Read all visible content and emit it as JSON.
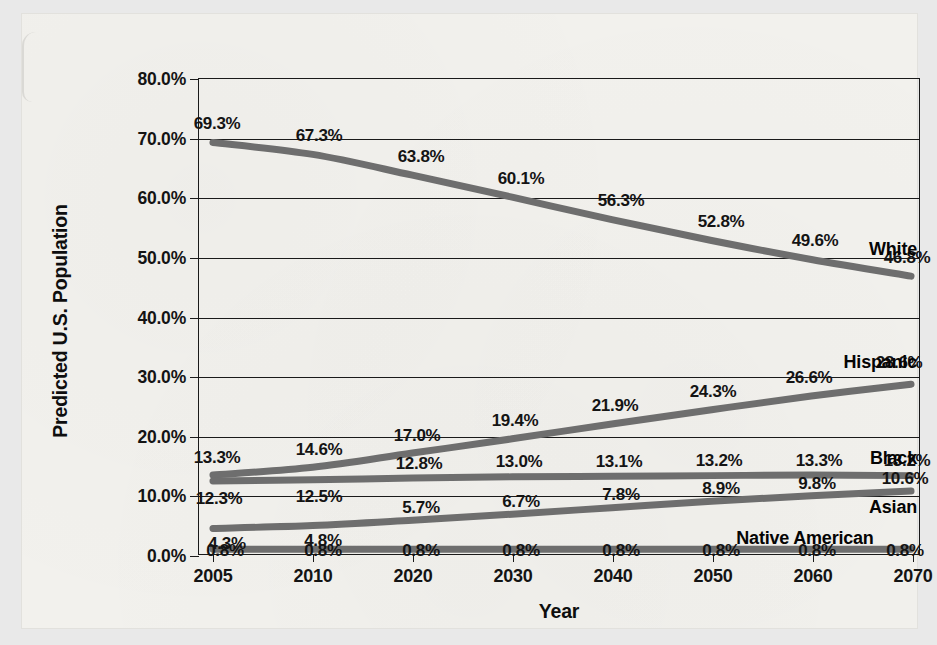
{
  "chart_data": {
    "type": "line",
    "title": "",
    "xlabel": "Year",
    "ylabel": "Predicted U.S. Population",
    "x": [
      2005,
      2010,
      2020,
      2030,
      2040,
      2050,
      2060,
      2070
    ],
    "categories": [
      "2005",
      "2010",
      "2020",
      "2030",
      "2040",
      "2050",
      "2060",
      "2070"
    ],
    "ylim": [
      0,
      80
    ],
    "ytick_labels": [
      "0.0%",
      "10.0%",
      "20.0%",
      "30.0%",
      "40.0%",
      "50.0%",
      "60.0%",
      "70.0%",
      "80.0%"
    ],
    "ytick_values": [
      0,
      10,
      20,
      30,
      40,
      50,
      60,
      70,
      80
    ],
    "grid": true,
    "legend_position": "inline-right",
    "line_color": "#6e6e6e",
    "axis_color": "#1a1a1a",
    "series": [
      {
        "name": "White",
        "values": [
          69.3,
          67.3,
          63.8,
          60.1,
          56.3,
          52.8,
          49.6,
          46.8
        ],
        "labels": [
          "69.3%",
          "67.3%",
          "63.8%",
          "60.1%",
          "56.3%",
          "52.8%",
          "49.6%",
          "46.8%"
        ]
      },
      {
        "name": "Hispanic",
        "values": [
          13.3,
          14.6,
          17.0,
          19.4,
          21.9,
          24.3,
          26.6,
          28.6
        ],
        "labels": [
          "13.3%",
          "14.6%",
          "17.0%",
          "19.4%",
          "21.9%",
          "24.3%",
          "26.6%",
          "28.6%"
        ]
      },
      {
        "name": "Black",
        "values": [
          12.3,
          12.5,
          12.8,
          13.0,
          13.1,
          13.2,
          13.3,
          13.2
        ],
        "labels": [
          "12.3%",
          "12.5%",
          "12.8%",
          "13.0%",
          "13.1%",
          "13.2%",
          "13.3%",
          "13.2%"
        ]
      },
      {
        "name": "Asian",
        "values": [
          4.3,
          4.8,
          5.7,
          6.7,
          7.8,
          8.9,
          9.8,
          10.6
        ],
        "labels": [
          "4.3%",
          "4.8%",
          "5.7%",
          "6.7%",
          "7.8%",
          "8.9%",
          "9.8%",
          "10.6%"
        ]
      },
      {
        "name": "Native American",
        "values": [
          0.8,
          0.8,
          0.8,
          0.8,
          0.8,
          0.8,
          0.8,
          0.8
        ],
        "labels": [
          "0.8%",
          "0.8%",
          "0.8%",
          "0.8%",
          "0.8%",
          "0.8%",
          "0.8%",
          "0.8%"
        ]
      }
    ]
  },
  "layout": {
    "series_name_anchor": [
      {
        "name": "White",
        "x_frac": 1.0,
        "y_value": 51.5
      },
      {
        "name": "Hispanic",
        "x_frac": 1.0,
        "y_value": 32.6
      },
      {
        "name": "Black",
        "x_frac": 1.0,
        "y_value": 16.5
      },
      {
        "name": "Asian",
        "x_frac": 1.0,
        "y_value": 8.3
      },
      {
        "name": "Native American",
        "x_frac": 0.94,
        "y_value": 3.1
      }
    ],
    "label_offsets": {
      "White": [
        {
          "dx": 4,
          "dy": -19
        },
        {
          "dx": 6,
          "dy": -19
        },
        {
          "dx": 8,
          "dy": -19
        },
        {
          "dx": 8,
          "dy": -19
        },
        {
          "dx": 8,
          "dy": -19
        },
        {
          "dx": 8,
          "dy": -19
        },
        {
          "dx": 2,
          "dy": -19
        },
        {
          "dx": -6,
          "dy": -19
        }
      ],
      "Hispanic": [
        {
          "dx": 4,
          "dy": -19
        },
        {
          "dx": 6,
          "dy": -19
        },
        {
          "dx": 4,
          "dy": -19
        },
        {
          "dx": 2,
          "dy": -19
        },
        {
          "dx": 2,
          "dy": -19
        },
        {
          "dx": 0,
          "dy": -19
        },
        {
          "dx": -4,
          "dy": -19
        },
        {
          "dx": -14,
          "dy": -22
        }
      ],
      "Black": [
        {
          "dx": 6,
          "dy": 16
        },
        {
          "dx": 6,
          "dy": 16
        },
        {
          "dx": 6,
          "dy": -16
        },
        {
          "dx": 6,
          "dy": -16
        },
        {
          "dx": 6,
          "dy": -16
        },
        {
          "dx": 6,
          "dy": -16
        },
        {
          "dx": 6,
          "dy": -16
        },
        {
          "dx": -6,
          "dy": -16
        }
      ],
      "Asian": [
        {
          "dx": 14,
          "dy": 14
        },
        {
          "dx": 10,
          "dy": 14
        },
        {
          "dx": 8,
          "dy": -14
        },
        {
          "dx": 8,
          "dy": -14
        },
        {
          "dx": 8,
          "dy": -14
        },
        {
          "dx": 8,
          "dy": -14
        },
        {
          "dx": 4,
          "dy": -14
        },
        {
          "dx": -8,
          "dy": -14
        }
      ],
      "Native American": [
        {
          "dx": 12,
          "dy": 0
        },
        {
          "dx": 10,
          "dy": 0
        },
        {
          "dx": 8,
          "dy": 0
        },
        {
          "dx": 8,
          "dy": 0
        },
        {
          "dx": 8,
          "dy": 0
        },
        {
          "dx": 8,
          "dy": 0
        },
        {
          "dx": 4,
          "dy": 0
        },
        {
          "dx": -8,
          "dy": 0
        }
      ]
    }
  }
}
